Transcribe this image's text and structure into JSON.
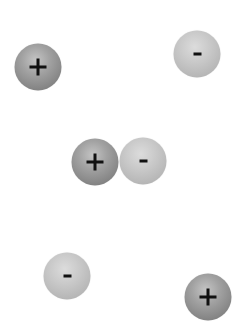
{
  "diagram": {
    "charges": [
      {
        "id": 0,
        "sign": "+",
        "type": "positive",
        "cx": 38,
        "cy": 67,
        "icon": "plus-icon"
      },
      {
        "id": 1,
        "sign": "-",
        "type": "negative",
        "cx": 197,
        "cy": 54,
        "icon": "minus-icon"
      },
      {
        "id": 2,
        "sign": "+",
        "type": "positive",
        "cx": 95,
        "cy": 162,
        "icon": "plus-icon"
      },
      {
        "id": 3,
        "sign": "-",
        "type": "negative",
        "cx": 143,
        "cy": 161,
        "icon": "minus-icon"
      },
      {
        "id": 4,
        "sign": "-",
        "type": "negative",
        "cx": 67,
        "cy": 276,
        "icon": "minus-icon"
      },
      {
        "id": 5,
        "sign": "+",
        "type": "positive",
        "cx": 208,
        "cy": 297,
        "icon": "plus-icon"
      }
    ],
    "colors": {
      "background": "#ffffff",
      "positive_sphere": "#8e8e8e",
      "negative_sphere": "#bdbdbd",
      "sign": "#111111"
    }
  }
}
